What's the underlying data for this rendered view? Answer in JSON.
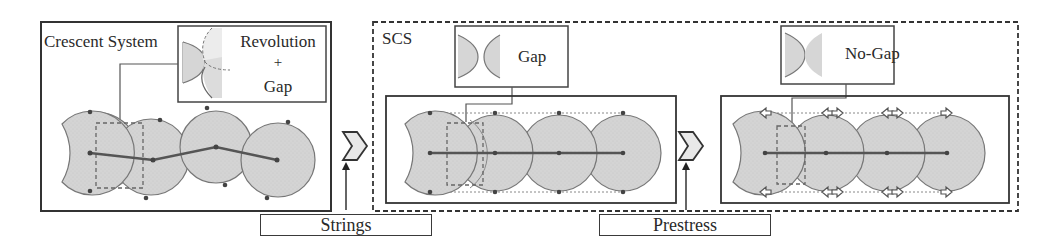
{
  "panels": {
    "crescent": {
      "title": "Crescent System",
      "inset": {
        "line1": "Revolution",
        "line2": "+",
        "line3": "Gap"
      }
    },
    "scs": {
      "title": "SCS",
      "gap_inset": {
        "label": "Gap"
      },
      "nogap_inset": {
        "label": "No-Gap"
      }
    }
  },
  "steps": {
    "strings": "Strings",
    "prestress": "Prestress"
  },
  "colors": {
    "disc_fill": "#d3d3d3",
    "disc_stroke": "#6e6e6e",
    "frame": "#333333",
    "chain": "#555555"
  }
}
